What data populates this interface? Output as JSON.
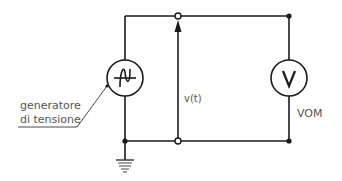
{
  "diagram": {
    "type": "circuit-schematic",
    "components": {
      "generator": {
        "label_line1": "generatore",
        "label_line2": "di tensione",
        "symbol": "ac-voltage-source"
      },
      "voltmeter": {
        "symbol_letter": "V",
        "label": "VOM"
      },
      "voltage": {
        "label": "v(t)"
      },
      "ground": {
        "symbol": "ground"
      }
    },
    "colors": {
      "wire": "#1a1a1a",
      "text": "#555555",
      "background": "#ffffff"
    }
  }
}
